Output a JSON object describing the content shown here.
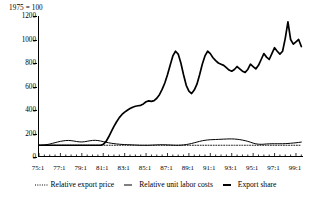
{
  "figure": {
    "units_note": "1975 = 100"
  },
  "chart_data": {
    "type": "line",
    "title": "",
    "subtitle": "",
    "xlabel": "",
    "ylabel": "1975 = 100",
    "grid": false,
    "legend_position": "bottom",
    "xlim": [
      1975.0,
      1999.75
    ],
    "ylim": [
      0,
      1200
    ],
    "yticks": [
      0,
      200,
      400,
      600,
      800,
      1000,
      1200
    ],
    "ytick_labels": [
      "0",
      "200",
      "400",
      "600",
      "800",
      "1000",
      "1200"
    ],
    "xticks": [
      1975,
      1977,
      1979,
      1981,
      1983,
      1985,
      1987,
      1989,
      1991,
      1993,
      1995,
      1997,
      1999
    ],
    "xtick_labels": [
      "75:1",
      "77:1",
      "79:1",
      "81:1",
      "83:1",
      "85:1",
      "87:1",
      "89:1",
      "91:1",
      "93:1",
      "95:1",
      "97:1",
      "99:1"
    ],
    "minor_tick_interval": 0.5,
    "x_start": 1975.0,
    "x_step": 0.25,
    "series": [
      {
        "name": "Relative export price",
        "style": "dotted",
        "color": "#000000",
        "width": 0.9,
        "values": [
          100,
          100,
          100,
          100,
          100,
          100,
          100,
          100,
          100,
          100,
          100,
          100,
          100,
          100,
          100,
          100,
          100,
          100,
          100,
          100,
          100,
          100,
          100,
          100,
          100,
          100,
          100,
          100,
          100,
          100,
          100,
          100,
          100,
          100,
          100,
          100,
          100,
          100,
          100,
          100,
          100,
          100,
          100,
          100,
          100,
          100,
          100,
          100,
          100,
          100,
          100,
          100,
          100,
          100,
          100,
          100,
          100,
          100,
          100,
          100,
          100,
          100,
          100,
          100,
          100,
          100,
          100,
          100,
          100,
          100,
          100,
          100,
          100,
          100,
          100,
          100,
          100,
          100,
          100,
          100,
          100,
          100,
          100,
          100,
          100,
          100,
          100,
          100,
          100,
          100,
          100,
          100,
          100,
          100,
          100,
          100,
          100,
          100,
          100
        ]
      },
      {
        "name": "Relative unit labor costs",
        "style": "solid-thin",
        "color": "#000000",
        "width": 1.0,
        "values": [
          100,
          101,
          103,
          106,
          110,
          116,
          122,
          128,
          133,
          137,
          140,
          141,
          139,
          136,
          132,
          129,
          128,
          130,
          134,
          138,
          141,
          142,
          140,
          136,
          131,
          126,
          121,
          117,
          114,
          111,
          109,
          107,
          106,
          105,
          104,
          103,
          102,
          101,
          100,
          100,
          100,
          100,
          101,
          102,
          103,
          104,
          104,
          104,
          103,
          102,
          101,
          100,
          100,
          101,
          103,
          106,
          110,
          115,
          121,
          127,
          133,
          138,
          142,
          145,
          147,
          148,
          149,
          150,
          151,
          152,
          153,
          154,
          154,
          153,
          151,
          148,
          144,
          139,
          133,
          126,
          118,
          112,
          109,
          108,
          109,
          111,
          112,
          113,
          113,
          113,
          113,
          113,
          114,
          115,
          117,
          119,
          121,
          124,
          127
        ]
      },
      {
        "name": "Export share",
        "style": "solid-thick",
        "color": "#000000",
        "width": 1.7,
        "values": [
          100,
          100,
          100,
          100,
          100,
          100,
          100,
          100,
          100,
          100,
          100,
          100,
          100,
          100,
          100,
          100,
          100,
          100,
          100,
          100,
          100,
          100,
          100,
          100,
          108,
          130,
          170,
          215,
          260,
          300,
          335,
          362,
          382,
          398,
          412,
          424,
          432,
          436,
          440,
          452,
          470,
          478,
          474,
          480,
          500,
          530,
          575,
          630,
          700,
          780,
          860,
          900,
          876,
          800,
          700,
          610,
          560,
          540,
          570,
          620,
          700,
          790,
          860,
          900,
          880,
          845,
          820,
          800,
          790,
          780,
          760,
          740,
          730,
          745,
          770,
          750,
          730,
          720,
          745,
          790,
          770,
          750,
          780,
          830,
          880,
          850,
          830,
          880,
          930,
          900,
          875,
          900,
          1010,
          1150,
          1000,
          960,
          980,
          1000,
          940
        ]
      }
    ]
  },
  "legend": {
    "items": [
      {
        "label": "Relative export price",
        "marker": "dotted-line-icon"
      },
      {
        "label": "Relative unit labor costs",
        "marker": "thin-line-icon"
      },
      {
        "label": "Export share",
        "marker": "thick-line-icon"
      }
    ]
  }
}
